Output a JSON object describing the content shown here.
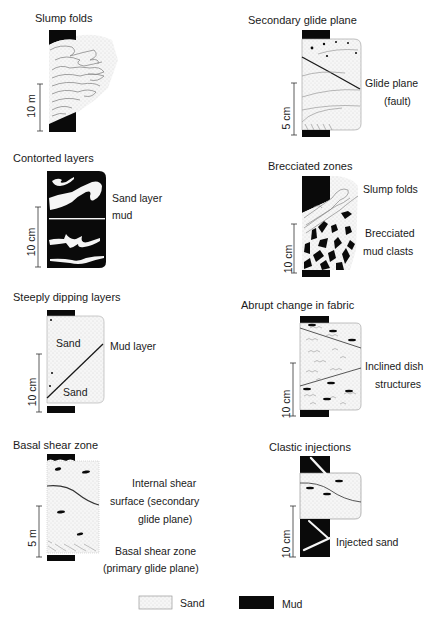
{
  "figure": {
    "panels": [
      {
        "id": "slump-folds",
        "title": "Slump folds",
        "scale": "10 m",
        "labels": []
      },
      {
        "id": "secondary-glide-plane",
        "title": "Secondary glide plane",
        "scale": "5 cm",
        "labels": [
          "Glide plane",
          "(fault)"
        ]
      },
      {
        "id": "contorted-layers",
        "title": "Contorted layers",
        "scale": "10 cm",
        "labels": [
          "Sand layer",
          "mud"
        ]
      },
      {
        "id": "brecciated-zones",
        "title": "Brecciated zones",
        "scale": "10 cm",
        "labels": [
          "Slump folds",
          "Brecciated",
          "mud clasts"
        ]
      },
      {
        "id": "steeply-dipping-layers",
        "title": "Steeply dipping layers",
        "scale": "10 cm",
        "labels": [
          "Mud layer",
          "Sand",
          "Sand"
        ]
      },
      {
        "id": "abrupt-change-in-fabric",
        "title": "Abrupt change in fabric",
        "scale": "10 cm",
        "labels": [
          "Inclined dish",
          "structures"
        ]
      },
      {
        "id": "basal-shear-zone",
        "title": "Basal shear zone",
        "scale": "5 m",
        "labels": [
          "Internal shear",
          "surface (secondary",
          "glide plane)",
          "Basal shear zone",
          "(primary glide plane)"
        ]
      },
      {
        "id": "clastic-injections",
        "title": "Clastic injections",
        "scale": "10 cm",
        "labels": [
          "Injected sand"
        ]
      }
    ],
    "legend": {
      "items": [
        {
          "label": "Sand",
          "swatch": "dotted-light"
        },
        {
          "label": "Mud",
          "swatch": "solid-black"
        }
      ]
    },
    "colors": {
      "mud": "#0a0a0a",
      "sand_fill": "#f4f4f4",
      "sand_outline": "#9a9a9a",
      "line": "#222222",
      "fold_line": "#8a8a8a"
    }
  }
}
